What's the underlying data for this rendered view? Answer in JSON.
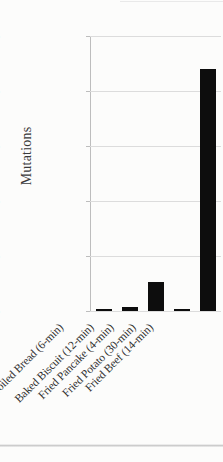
{
  "chart_data": {
    "type": "bar",
    "title": "",
    "xlabel": "",
    "ylabel": "Mutations",
    "categories": [
      "Broiled Bread (6-min)",
      "Baked Biscuit (12-min)",
      "Fried Pancake (4-min)",
      "Fried Potato (30-min)",
      "Fried Beef (14-min)"
    ],
    "values": [
      150,
      350,
      2600,
      180,
      22000
    ],
    "ylim": [
      0,
      25000
    ],
    "yticks": [
      0,
      5000,
      10000,
      15000,
      20000,
      25000
    ],
    "ytick_labels": [
      "0",
      "5000",
      "10000",
      "15000",
      "20000",
      "25000"
    ],
    "grid": true,
    "legend": "none",
    "bar_color": "#0d0d0d",
    "gridline_color": "#dcdcdc",
    "axis_color": "#bdbdbd",
    "background_color": "#fcfcfb"
  }
}
